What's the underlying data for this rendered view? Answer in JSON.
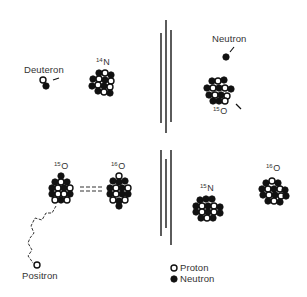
{
  "diagram": {
    "type": "nuclear-reaction-diagram",
    "colors": {
      "neutron": "#111111",
      "proton": "#ffffff",
      "stroke": "#111111",
      "background": "#ffffff"
    },
    "top_row": {
      "deuteron_label": "Deuteron",
      "n14": {
        "mass": "14",
        "symbol": "N"
      },
      "neutron_label": "Neutron",
      "o15": {
        "mass": "15",
        "symbol": "O"
      }
    },
    "bottom_row": {
      "o15": {
        "mass": "15",
        "symbol": "O"
      },
      "o16": {
        "mass": "16",
        "symbol": "O"
      },
      "equivalence": "====",
      "positron_label": "Positron",
      "n15": {
        "mass": "15",
        "symbol": "N"
      },
      "o16_right": {
        "mass": "16",
        "symbol": "O"
      }
    },
    "legend": [
      {
        "icon": "open-circle",
        "label": "Proton"
      },
      {
        "icon": "filled-circle",
        "label": "Neutron"
      }
    ]
  }
}
